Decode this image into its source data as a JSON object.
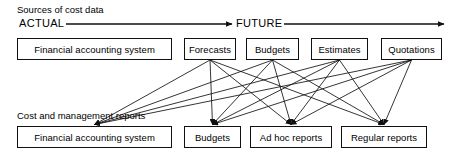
{
  "diagram": {
    "title_caption": "Sources of cost data",
    "reports_caption": "Cost and management reports",
    "timeline": {
      "start_label": "ACTUAL",
      "end_label": "FUTURE",
      "arrow_icon": "right-arrow-icon"
    },
    "sources_row": [
      {
        "id": "source-financial-accounting-system",
        "label": "Financial accounting system",
        "x": 17,
        "y": 38,
        "w": 155,
        "h": 22
      },
      {
        "id": "source-forecasts",
        "label": "Forecasts",
        "x": 184,
        "y": 38,
        "w": 52,
        "h": 22
      },
      {
        "id": "source-budgets",
        "label": "Budgets",
        "x": 246,
        "y": 38,
        "w": 53,
        "h": 22
      },
      {
        "id": "source-estimates",
        "label": "Estimates",
        "x": 311,
        "y": 38,
        "w": 57,
        "h": 22
      },
      {
        "id": "source-quotations",
        "label": "Quotations",
        "x": 381,
        "y": 38,
        "w": 61,
        "h": 22
      }
    ],
    "reports_row": [
      {
        "id": "report-financial-accounting-system",
        "label": "Financial accounting system",
        "x": 17,
        "y": 126,
        "w": 155,
        "h": 22
      },
      {
        "id": "report-budgets",
        "label": "Budgets",
        "x": 184,
        "y": 126,
        "w": 57,
        "h": 22
      },
      {
        "id": "report-ad-hoc-reports",
        "label": "Ad hoc reports",
        "x": 250,
        "y": 126,
        "w": 82,
        "h": 22
      },
      {
        "id": "report-regular-reports",
        "label": "Regular reports",
        "x": 341,
        "y": 126,
        "w": 86,
        "h": 22
      }
    ],
    "connections": [
      {
        "from": "source-forecasts",
        "to": "report-financial-accounting-system"
      },
      {
        "from": "source-forecasts",
        "to": "report-budgets"
      },
      {
        "from": "source-forecasts",
        "to": "report-ad-hoc-reports"
      },
      {
        "from": "source-forecasts",
        "to": "report-regular-reports"
      },
      {
        "from": "source-budgets",
        "to": "report-financial-accounting-system"
      },
      {
        "from": "source-budgets",
        "to": "report-budgets"
      },
      {
        "from": "source-budgets",
        "to": "report-ad-hoc-reports"
      },
      {
        "from": "source-budgets",
        "to": "report-regular-reports"
      },
      {
        "from": "source-estimates",
        "to": "report-financial-accounting-system"
      },
      {
        "from": "source-estimates",
        "to": "report-budgets"
      },
      {
        "from": "source-estimates",
        "to": "report-ad-hoc-reports"
      },
      {
        "from": "source-estimates",
        "to": "report-regular-reports"
      },
      {
        "from": "source-quotations",
        "to": "report-financial-accounting-system"
      },
      {
        "from": "source-quotations",
        "to": "report-budgets"
      },
      {
        "from": "source-quotations",
        "to": "report-ad-hoc-reports"
      },
      {
        "from": "source-quotations",
        "to": "report-regular-reports"
      }
    ],
    "colors": {
      "line": "#111111",
      "box_border": "#111111",
      "text": "#000000",
      "background": "#ffffff"
    },
    "timeline_geometry": {
      "y": 24,
      "x_start": 66,
      "x_gap_left": 232,
      "x_gap_right": 272,
      "x_end": 444
    }
  }
}
